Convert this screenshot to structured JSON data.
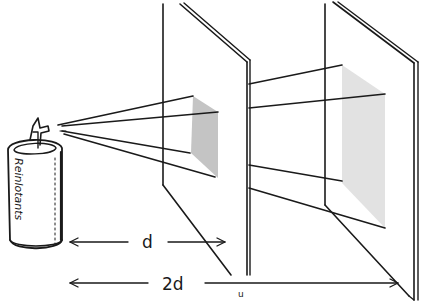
{
  "diagram": {
    "source": {
      "label": "Reinlotants",
      "type": "spray-can"
    },
    "screens": [
      {
        "name": "near-screen",
        "distance_label": "d"
      },
      {
        "name": "far-screen",
        "distance_label": "2d"
      }
    ],
    "dimensions": {
      "near_label": "d",
      "far_label": "2d"
    },
    "stray_mark": "u",
    "colors": {
      "ink": "#1a1a1a",
      "patch_near": "#c4c4c4",
      "patch_far": "#e2e2e2",
      "background": "#ffffff"
    }
  }
}
